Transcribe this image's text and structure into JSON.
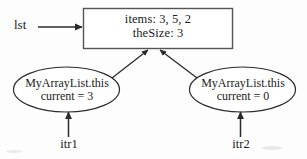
{
  "diagram": {
    "stroke_color": "#2b2b2b",
    "background_color": "#fdfdfd",
    "list_pointer": {
      "label": "lst",
      "arrow": "arrow-right-to-list-box"
    },
    "list_box": {
      "name": "MyArrayList object box",
      "line1": "items: 3, 5, 2",
      "line2": "theSize: 3"
    },
    "iterators": [
      {
        "id": "itr1",
        "shape": "ellipse",
        "line1": "MyArrayList.this",
        "line2": "current = 3",
        "variable_label": "itr1"
      },
      {
        "id": "itr2",
        "shape": "ellipse",
        "line1": "MyArrayList.this",
        "line2": "current = 0",
        "variable_label": "itr2"
      }
    ]
  }
}
